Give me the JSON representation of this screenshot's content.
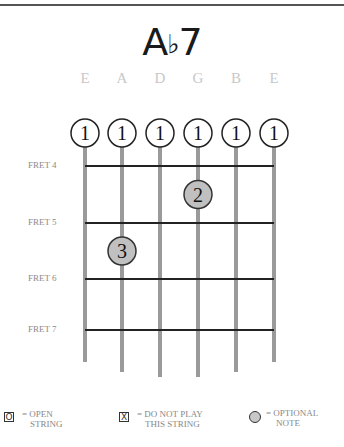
{
  "chord": {
    "root": "A",
    "accidental": "♭",
    "quality": "7"
  },
  "strings": [
    "E",
    "A",
    "D",
    "G",
    "B",
    "E"
  ],
  "frets": [
    "FRET 4",
    "FRET 5",
    "FRET 6",
    "FRET 7"
  ],
  "barre": {
    "finger": "1",
    "strings": [
      1,
      2,
      3,
      4,
      5,
      6
    ]
  },
  "notes": [
    {
      "finger": "2",
      "string": 4,
      "fret_index": 0
    },
    {
      "finger": "3",
      "string": 2,
      "fret_index": 1
    }
  ],
  "legend": {
    "open": {
      "symbol": "O",
      "line1": "= OPEN",
      "line2": "STRING"
    },
    "mute": {
      "symbol": "X",
      "line1": "= DO NOT PLAY",
      "line2": "THIS STRING"
    },
    "optional": {
      "line1": "= OPTIONAL",
      "line2": "NOTE"
    }
  },
  "colors": {
    "string": "#9a9a9a",
    "fret": "#222222",
    "note_fill": "#c0c0c0",
    "barre_fill": "#ffffff"
  }
}
